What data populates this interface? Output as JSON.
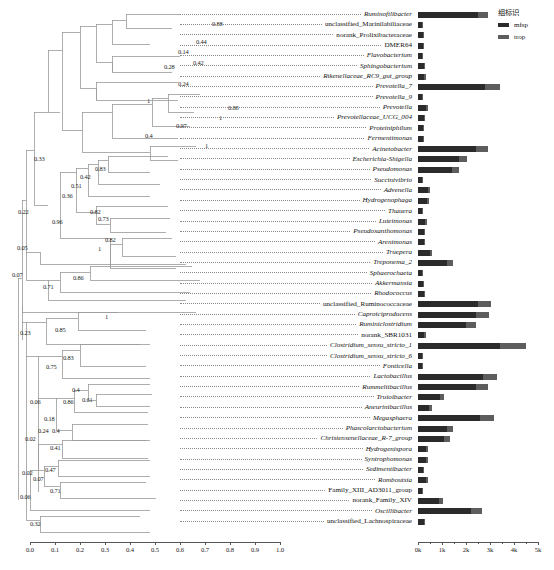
{
  "legend": {
    "title": "组标识",
    "items": [
      {
        "label": "mfsp",
        "color": "#2b2b2b"
      },
      {
        "label": "trop",
        "color": "#5d5d5d"
      }
    ]
  },
  "tree_axis": {
    "ticks": [
      "0.0",
      "0.1",
      "0.2",
      "0.3",
      "0.4",
      "0.5",
      "0.6",
      "0.7",
      "0.8",
      "0.9",
      "1.0"
    ],
    "min": 0.0,
    "max": 1.0
  },
  "bar_axis": {
    "ticks": [
      "0k",
      "1k",
      "2k",
      "3k",
      "4k",
      "5k"
    ],
    "min": 0,
    "max": 5000
  },
  "chart_data": {
    "type": "bar",
    "title": "",
    "xlabel": "",
    "ylabel": "",
    "orientation": "horizontal",
    "stacked": true,
    "xlim": [
      0,
      5000
    ],
    "grid": false,
    "legend_position": "top-right",
    "series": [
      {
        "name": "mfsp",
        "color": "#2b2b2b"
      },
      {
        "name": "trop",
        "color": "#5d5d5d"
      }
    ],
    "categories": [
      "Ruminofilibacter",
      "unclassified_Marinilabiliaceae",
      "norank_Prolixibacteraceae",
      "DMER64",
      "Flavobacterium",
      "Sphingobacterium",
      "Rikenellaceae_RC9_gut_group",
      "Prevotella_7",
      "Prevotella_9",
      "Prevotella",
      "Prevotellaceae_UCG_004",
      "Proteiniphilum",
      "Fermentimonas",
      "Acinetobacter",
      "Escherichia-Shigella",
      "Pseudomonas",
      "Succinivibrio",
      "Advenella",
      "Hydrogenophaga",
      "Thauera",
      "Luteimonas",
      "Pseudoxanthomonas",
      "Arenimonas",
      "Truepera",
      "Treponema_2",
      "Sphaerochaeta",
      "Akkermansia",
      "Rhodococcus",
      "unclassified_Ruminococcaceae",
      "Caproiciproducens",
      "Ruminiclostridium",
      "norank_SBR1031",
      "Clostridium_sensu_stricto_1",
      "Clostridium_sensu_stricto_6",
      "Fonticella",
      "Lactobacillus",
      "Rummeliibacillus",
      "Truioibacter",
      "Aneurinibacillus",
      "Megasphaera",
      "Phascolarctobacterium",
      "Christensenellaceae_R-7_group",
      "Hydrogenispora",
      "Syntrophomonas",
      "Sedimentibacter",
      "Romboutsia",
      "Family_XIII_AD3011_group",
      "norank_Family_XIV",
      "Oscillibacter",
      "unclassified_Lachnospiraceae"
    ],
    "values": {
      "mfsp": [
        2500,
        160,
        210,
        190,
        170,
        240,
        260,
        2800,
        170,
        330,
        230,
        200,
        210,
        2400,
        1700,
        1400,
        180,
        420,
        360,
        170,
        300,
        230,
        230,
        480,
        1200,
        150,
        210,
        230,
        2500,
        2400,
        2000,
        260,
        3400,
        180,
        180,
        2700,
        2400,
        900,
        470,
        2600,
        1200,
        1100,
        330,
        330,
        190,
        330,
        150,
        870,
        2200,
        230
      ],
      "trop": [
        400,
        40,
        45,
        40,
        35,
        50,
        55,
        620,
        35,
        70,
        50,
        45,
        45,
        520,
        360,
        300,
        40,
        90,
        80,
        35,
        65,
        50,
        50,
        100,
        260,
        35,
        45,
        50,
        560,
        540,
        430,
        55,
        1100,
        40,
        40,
        580,
        520,
        200,
        100,
        560,
        260,
        240,
        70,
        70,
        40,
        70,
        35,
        190,
        480,
        50
      ]
    }
  },
  "tips": [
    {
      "label": "Ruminofilibacter",
      "italic": true
    },
    {
      "label": "unclassified_Marinilabiliaceae",
      "italic": false
    },
    {
      "label": "norank_Prolixibacteraceae",
      "italic": false
    },
    {
      "label": "DMER64",
      "italic": false
    },
    {
      "label": "Flavobacterium",
      "italic": true
    },
    {
      "label": "Sphingobacterium",
      "italic": true
    },
    {
      "label": "Rikenellaceae_RC9_gut_group",
      "italic": true
    },
    {
      "label": "Prevotella_7",
      "italic": true
    },
    {
      "label": "Prevotella_9",
      "italic": true
    },
    {
      "label": "Prevotella",
      "italic": true
    },
    {
      "label": "Prevotellaceae_UCG_004",
      "italic": true
    },
    {
      "label": "Proteiniphilum",
      "italic": true
    },
    {
      "label": "Fermentimonas",
      "italic": true
    },
    {
      "label": "Acinetobacter",
      "italic": true
    },
    {
      "label": "Escherichia-Shigella",
      "italic": true
    },
    {
      "label": "Pseudomonas",
      "italic": true
    },
    {
      "label": "Succinivibrio",
      "italic": true
    },
    {
      "label": "Advenella",
      "italic": true
    },
    {
      "label": "Hydrogenophaga",
      "italic": true
    },
    {
      "label": "Thauera",
      "italic": true
    },
    {
      "label": "Luteimonas",
      "italic": true
    },
    {
      "label": "Pseudoxanthomonas",
      "italic": true
    },
    {
      "label": "Arenimonas",
      "italic": true
    },
    {
      "label": "Truepera",
      "italic": true
    },
    {
      "label": "Treponema_2",
      "italic": true
    },
    {
      "label": "Sphaerochaeta",
      "italic": true
    },
    {
      "label": "Akkermansia",
      "italic": true
    },
    {
      "label": "Rhodococcus",
      "italic": true
    },
    {
      "label": "unclassified_Ruminococcaceae",
      "italic": false
    },
    {
      "label": "Caproiciproducens",
      "italic": true
    },
    {
      "label": "Ruminiclostridium",
      "italic": true
    },
    {
      "label": "norank_SBR1031",
      "italic": false
    },
    {
      "label": "Clostridium_sensu_stricto_1",
      "italic": true
    },
    {
      "label": "Clostridium_sensu_stricto_6",
      "italic": true
    },
    {
      "label": "Fonticella",
      "italic": true
    },
    {
      "label": "Lactobacillus",
      "italic": true
    },
    {
      "label": "Rummeliibacillus",
      "italic": true
    },
    {
      "label": "Truioibacter",
      "italic": true
    },
    {
      "label": "Aneurinibacillus",
      "italic": true
    },
    {
      "label": "Megasphaera",
      "italic": true
    },
    {
      "label": "Phascolarctobacterium",
      "italic": true
    },
    {
      "label": "Christensenellaceae_R-7_group",
      "italic": true
    },
    {
      "label": "Hydrogenispora",
      "italic": true
    },
    {
      "label": "Syntrophomonas",
      "italic": true
    },
    {
      "label": "Sedimentibacter",
      "italic": true
    },
    {
      "label": "Romboutsia",
      "italic": true
    },
    {
      "label": "Family_XIII_AD3011_group",
      "italic": false
    },
    {
      "label": "norank_Family_XIV",
      "italic": false
    },
    {
      "label": "Oscillibacter",
      "italic": true
    },
    {
      "label": "unclassified_Lachnospiraceae",
      "italic": false
    }
  ],
  "node_supports": [
    {
      "value": "0.88",
      "x": 212,
      "y": 21
    },
    {
      "value": "0.44",
      "x": 196,
      "y": 39
    },
    {
      "value": "0.14",
      "x": 178,
      "y": 49
    },
    {
      "value": "0.42",
      "x": 193,
      "y": 60
    },
    {
      "value": "0.28",
      "x": 164,
      "y": 64
    },
    {
      "value": "0.24",
      "x": 178,
      "y": 81
    },
    {
      "value": "1",
      "x": 147,
      "y": 98
    },
    {
      "value": "0.88",
      "x": 228,
      "y": 105
    },
    {
      "value": "1",
      "x": 219,
      "y": 115
    },
    {
      "value": "0.97",
      "x": 176,
      "y": 123
    },
    {
      "value": "0.4",
      "x": 145,
      "y": 133
    },
    {
      "value": "1",
      "x": 205,
      "y": 143
    },
    {
      "value": "0.33",
      "x": 34,
      "y": 156
    },
    {
      "value": "0.83",
      "x": 95,
      "y": 166
    },
    {
      "value": "0.42",
      "x": 80,
      "y": 174
    },
    {
      "value": "0.51",
      "x": 71,
      "y": 183
    },
    {
      "value": "0.36",
      "x": 62,
      "y": 193
    },
    {
      "value": "0.22",
      "x": 18,
      "y": 209
    },
    {
      "value": "0.82",
      "x": 90,
      "y": 209
    },
    {
      "value": "0.73",
      "x": 98,
      "y": 216
    },
    {
      "value": "0.96",
      "x": 52,
      "y": 219
    },
    {
      "value": "0.82",
      "x": 105,
      "y": 237
    },
    {
      "value": "1",
      "x": 98,
      "y": 246
    },
    {
      "value": "0.05",
      "x": 17,
      "y": 245
    },
    {
      "value": "0.07",
      "x": 12,
      "y": 272
    },
    {
      "value": "0.86",
      "x": 73,
      "y": 275
    },
    {
      "value": "0.71",
      "x": 43,
      "y": 284
    },
    {
      "value": "1",
      "x": 105,
      "y": 314
    },
    {
      "value": "0.23",
      "x": 20,
      "y": 330
    },
    {
      "value": "0.85",
      "x": 55,
      "y": 327
    },
    {
      "value": "0.83",
      "x": 63,
      "y": 355
    },
    {
      "value": "0.75",
      "x": 46,
      "y": 364
    },
    {
      "value": "0.4",
      "x": 72,
      "y": 387
    },
    {
      "value": "0.86",
      "x": 63,
      "y": 399
    },
    {
      "value": "0.61",
      "x": 82,
      "y": 397
    },
    {
      "value": "0.06",
      "x": 30,
      "y": 399
    },
    {
      "value": "0.18",
      "x": 44,
      "y": 416
    },
    {
      "value": "0.24",
      "x": 38,
      "y": 428
    },
    {
      "value": "0.4",
      "x": 52,
      "y": 428
    },
    {
      "value": "0.02",
      "x": 25,
      "y": 436
    },
    {
      "value": "0.41",
      "x": 50,
      "y": 445
    },
    {
      "value": "0.02",
      "x": 22,
      "y": 470
    },
    {
      "value": "0.47",
      "x": 45,
      "y": 467
    },
    {
      "value": "0.07",
      "x": 33,
      "y": 476
    },
    {
      "value": "0.71",
      "x": 50,
      "y": 488
    },
    {
      "value": "0.06",
      "x": 20,
      "y": 494
    },
    {
      "value": "0.32",
      "x": 30,
      "y": 521
    }
  ]
}
